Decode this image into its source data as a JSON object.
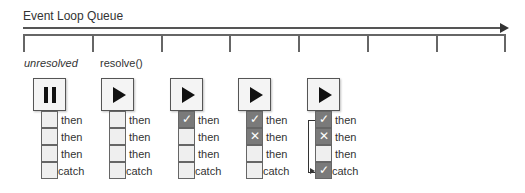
{
  "title": "Event Loop Queue",
  "timeline": {
    "tick_count": 8
  },
  "column_labels": {
    "col1": "unresolved",
    "col2": "resolve()"
  },
  "icons": {
    "pause": "pause-icon",
    "play": "play-icon",
    "check": "✓",
    "cross": "✕"
  },
  "colors": {
    "filled_cell": "#7a7a7a",
    "empty_cell": "#efefef",
    "box_border": "#555555"
  },
  "promises": [
    {
      "state": "pause",
      "cells": [
        {
          "label": "then",
          "mark": ""
        },
        {
          "label": "then",
          "mark": ""
        },
        {
          "label": "then",
          "mark": ""
        },
        {
          "label": "catch",
          "mark": ""
        }
      ]
    },
    {
      "state": "play",
      "cells": [
        {
          "label": "then",
          "mark": ""
        },
        {
          "label": "then",
          "mark": ""
        },
        {
          "label": "then",
          "mark": ""
        },
        {
          "label": "catch",
          "mark": ""
        }
      ]
    },
    {
      "state": "play",
      "cells": [
        {
          "label": "then",
          "mark": "✓"
        },
        {
          "label": "then",
          "mark": ""
        },
        {
          "label": "then",
          "mark": ""
        },
        {
          "label": "catch",
          "mark": ""
        }
      ]
    },
    {
      "state": "play",
      "cells": [
        {
          "label": "then",
          "mark": "✓"
        },
        {
          "label": "then",
          "mark": "✕"
        },
        {
          "label": "then",
          "mark": ""
        },
        {
          "label": "catch",
          "mark": ""
        }
      ]
    },
    {
      "state": "play",
      "cells": [
        {
          "label": "then",
          "mark": "✓"
        },
        {
          "label": "then",
          "mark": "✕"
        },
        {
          "label": "then",
          "mark": ""
        },
        {
          "label": "catch",
          "mark": "✓"
        }
      ]
    }
  ]
}
